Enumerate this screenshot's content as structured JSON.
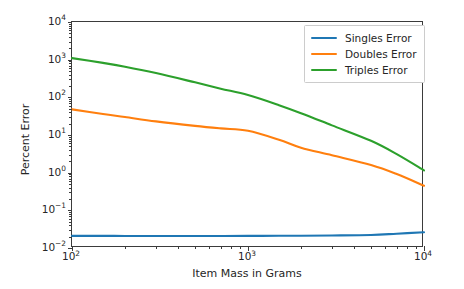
{
  "chart_data": {
    "type": "line",
    "title": "",
    "xlabel": "Item Mass in Grams",
    "ylabel": "Percent Error",
    "xscale": "log",
    "yscale": "log",
    "xlim": [
      100,
      10000
    ],
    "ylim": [
      0.01,
      10000
    ],
    "grid": false,
    "legend_position": "upper right",
    "xticks": [
      100,
      1000,
      10000
    ],
    "xtick_labels": [
      "10²",
      "10³",
      "10⁴"
    ],
    "yticks": [
      0.01,
      0.1,
      1,
      10,
      100,
      1000,
      10000
    ],
    "ytick_labels": [
      "10⁻²",
      "10⁻¹",
      "10⁰",
      "10¹",
      "10²",
      "10³",
      "10⁴"
    ],
    "x": [
      100,
      150,
      200,
      300,
      500,
      700,
      1000,
      1500,
      2000,
      3000,
      5000,
      7000,
      10000
    ],
    "series": [
      {
        "name": "Singles Error",
        "color": "#1f77b4",
        "values": [
          0.021,
          0.021,
          0.0209,
          0.0209,
          0.0209,
          0.0209,
          0.021,
          0.0211,
          0.0212,
          0.0215,
          0.0222,
          0.024,
          0.0262
        ]
      },
      {
        "name": "Doubles Error",
        "color": "#ff7f0e",
        "values": [
          48.0,
          36.0,
          30.0,
          23.0,
          17.5,
          15.0,
          13.0,
          7.5,
          4.6,
          2.9,
          1.6,
          0.92,
          0.45
        ]
      },
      {
        "name": "Triples Error",
        "color": "#2ca02c",
        "values": [
          1100.0,
          820.0,
          650.0,
          440.0,
          250.0,
          170.0,
          115.0,
          62.0,
          38.0,
          18.0,
          7.0,
          3.1,
          1.15
        ]
      }
    ]
  },
  "legend": {
    "entries": [
      {
        "label": "Singles Error",
        "color": "#1f77b4"
      },
      {
        "label": "Doubles Error",
        "color": "#ff7f0e"
      },
      {
        "label": "Triples Error",
        "color": "#2ca02c"
      }
    ]
  },
  "axes": {
    "x_title": "Item Mass in Grams",
    "y_title": "Percent Error"
  }
}
